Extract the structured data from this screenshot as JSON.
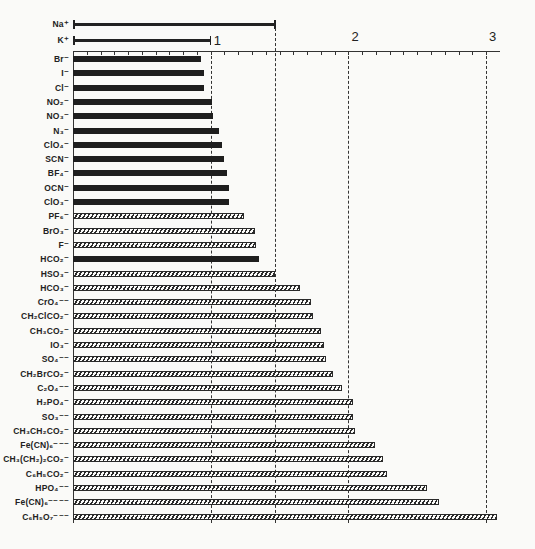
{
  "chart_data": {
    "type": "bar",
    "orientation": "horizontal",
    "title": "",
    "xlabel": "",
    "ylabel": "",
    "xlim": [
      0,
      3.1
    ],
    "x_ticks": [
      1,
      2,
      3
    ],
    "x_minor_tick_step": 0.1,
    "grid": "dashed vertical lines at 1, 1.47, 2, 3",
    "legend": "solid bars vs hatched bars (no legend text)",
    "cations": [
      {
        "label": "Na⁺",
        "value": 1.47
      },
      {
        "label": "K⁺",
        "value": 1.0
      }
    ],
    "categories": [
      "Br⁻",
      "I⁻",
      "Cl⁻",
      "NO₂⁻",
      "NO₃⁻",
      "N₃⁻",
      "ClO₄⁻",
      "SCN⁻",
      "BF₄⁻",
      "OCN⁻",
      "ClO₃⁻",
      "PF₆⁻",
      "BrO₃⁻",
      "F⁻",
      "HCO₂⁻",
      "HSO₃⁻",
      "HCO₃⁻",
      "CrO₄⁻⁻",
      "CH₂ClCO₂⁻",
      "CH₃CO₂⁻",
      "IO₃⁻",
      "SO₄⁻⁻",
      "CH₂BrCO₂⁻",
      "C₂O₄⁻⁻",
      "H₂PO₄⁻",
      "SO₃⁻⁻",
      "CH₃CH₂CO₂⁻",
      "Fe(CN)₆⁻⁻⁻",
      "CH₃(CH₂)₂CO₂⁻",
      "C₆H₅CO₂⁻",
      "HPO₄⁻⁻",
      "Fe(CN)₆⁻⁻⁻⁻",
      "C₆H₅O₇⁻⁻⁻"
    ],
    "values": [
      0.93,
      0.95,
      0.95,
      1.01,
      1.02,
      1.06,
      1.08,
      1.1,
      1.12,
      1.13,
      1.13,
      1.24,
      1.32,
      1.33,
      1.35,
      1.47,
      1.65,
      1.73,
      1.74,
      1.8,
      1.82,
      1.84,
      1.89,
      1.95,
      2.03,
      2.03,
      2.05,
      2.19,
      2.25,
      2.28,
      2.57,
      2.66,
      3.08
    ],
    "styles": [
      "solid",
      "solid",
      "solid",
      "solid",
      "solid",
      "solid",
      "solid",
      "solid",
      "solid",
      "solid",
      "solid",
      "hatched",
      "hatched",
      "hatched",
      "solid",
      "hatched",
      "hatched",
      "hatched",
      "hatched",
      "hatched",
      "hatched",
      "hatched",
      "hatched",
      "hatched",
      "hatched",
      "hatched",
      "hatched",
      "hatched",
      "hatched",
      "hatched",
      "hatched",
      "hatched",
      "hatched"
    ]
  },
  "colors": {
    "bar": "#1e1e1e",
    "background": "#fafaf8"
  }
}
